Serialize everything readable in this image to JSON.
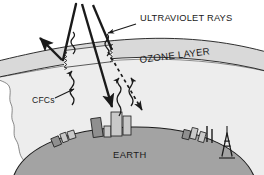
{
  "diagram": {
    "title_hidden": "Ozone layer depletion diagram",
    "labels": {
      "ultraviolet_rays": "ULTRAVIOLET RAYS",
      "ozone_layer": "OZONE LAYER",
      "cfcs": "CFCs",
      "earth": "EARTH"
    },
    "colors": {
      "background": "#ffffff",
      "ozone_band": "#d9d9d9",
      "atmosphere": "#ededed",
      "earth": "#a3a3a3",
      "stroke": "#1a1a1a",
      "building_dark": "#8f8f8f",
      "building_light": "#c9c9c9"
    },
    "elements": {
      "incoming_ray_label": "incoming ultraviolet ray",
      "reflected_ray_label": "reflected ultraviolet ray",
      "penetrating_ray_label": "ray penetrating ozone hole",
      "dashed_ray_label": "scattered ultraviolet ray",
      "cfc_wave_label": "rising CFC molecules",
      "ozone_hole_label": "ozone hole"
    }
  }
}
